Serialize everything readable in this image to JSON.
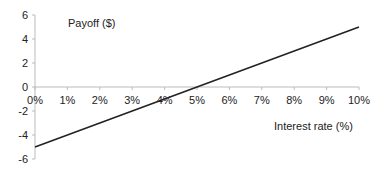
{
  "chart_data": {
    "type": "line",
    "title": "",
    "ylabel": "Payoff ($)",
    "xlabel": "Interest rate (%)",
    "x": [
      0,
      1,
      2,
      3,
      4,
      5,
      6,
      7,
      8,
      9,
      10
    ],
    "x_tick_labels": [
      "0%",
      "1%",
      "2%",
      "3%",
      "4%",
      "5%",
      "6%",
      "7%",
      "8%",
      "9%",
      "10%"
    ],
    "y_tick_labels": [
      "6",
      "4",
      "2",
      "0",
      "-2",
      "-4",
      "-6"
    ],
    "y_ticks": [
      6,
      4,
      2,
      0,
      -2,
      -4,
      -6
    ],
    "xlim": [
      0,
      10
    ],
    "ylim": [
      -6,
      6
    ],
    "grid": false,
    "legend": null,
    "series": [
      {
        "name": "Payoff",
        "x": [
          0,
          1,
          2,
          3,
          4,
          5,
          6,
          7,
          8,
          9,
          10
        ],
        "values": [
          -5,
          -4,
          -3,
          -2,
          -1,
          0,
          1,
          2,
          3,
          4,
          5
        ],
        "color": "#222222"
      }
    ]
  },
  "colors": {
    "axis": "#bbbbbb",
    "line": "#222222",
    "text": "#222222"
  }
}
